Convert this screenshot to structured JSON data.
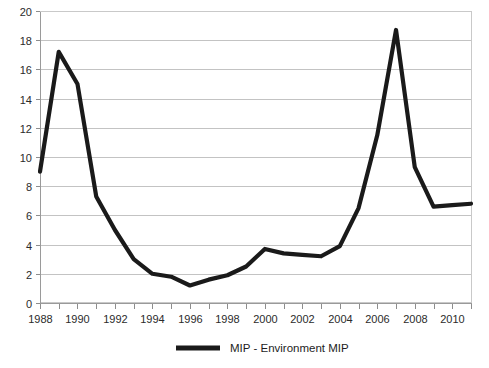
{
  "chart_data": {
    "type": "line",
    "title": "",
    "subtitle": "",
    "xlabel": "",
    "ylabel": "",
    "grid": true,
    "legend_position": "bottom-center",
    "xlim": [
      1988,
      2011
    ],
    "ylim": [
      0,
      20
    ],
    "y_ticks": [
      0,
      2,
      4,
      6,
      8,
      10,
      12,
      14,
      16,
      18,
      20
    ],
    "y_tick_labels": [
      "0",
      "2",
      "4",
      "6",
      "8",
      "10",
      "12",
      "14",
      "16",
      "18",
      "20"
    ],
    "x_ticks": [
      1988,
      1989,
      1990,
      1991,
      1992,
      1993,
      1994,
      1995,
      1996,
      1997,
      1998,
      1999,
      2000,
      2001,
      2002,
      2003,
      2004,
      2005,
      2006,
      2007,
      2008,
      2009,
      2010,
      2011
    ],
    "x_tick_labels_shown": [
      "1988",
      "1990",
      "1992",
      "1994",
      "1996",
      "1998",
      "2000",
      "2002",
      "2004",
      "2006",
      "2008",
      "2010"
    ],
    "x": [
      1988,
      1989,
      1990,
      1991,
      1992,
      1993,
      1994,
      1995,
      1996,
      1997,
      1998,
      1999,
      2000,
      2001,
      2002,
      2003,
      2004,
      2005,
      2006,
      2007,
      2008,
      2009,
      2010,
      2011
    ],
    "series": [
      {
        "name": "MIP - Environment MIP",
        "color": "#1a1a1a",
        "values": [
          9.0,
          17.2,
          15.0,
          7.3,
          5.0,
          3.0,
          2.0,
          1.8,
          1.2,
          1.6,
          1.9,
          2.5,
          3.7,
          3.4,
          3.3,
          3.2,
          3.9,
          6.5,
          11.5,
          18.7,
          9.3,
          6.6,
          6.7,
          6.8
        ]
      }
    ]
  },
  "legend": {
    "entries": [
      {
        "label": "MIP - Environment MIP",
        "color": "#1a1a1a"
      }
    ]
  },
  "axes": {
    "y_axis_name": "value-axis",
    "x_axis_name": "year-axis"
  }
}
